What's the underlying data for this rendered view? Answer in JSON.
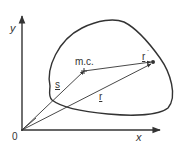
{
  "diagram": {
    "axes": {
      "x_label": "x",
      "y_label": "y",
      "origin_label": "0"
    },
    "points": {
      "center_of_mass_label": "m.c.",
      "particle_dot": "point"
    },
    "vectors": {
      "s_label": "s",
      "r_label": "r",
      "r_prime_label": "r",
      "prime_mark": "´"
    },
    "colors": {
      "stroke": "#333333",
      "background": "#ffffff"
    }
  }
}
